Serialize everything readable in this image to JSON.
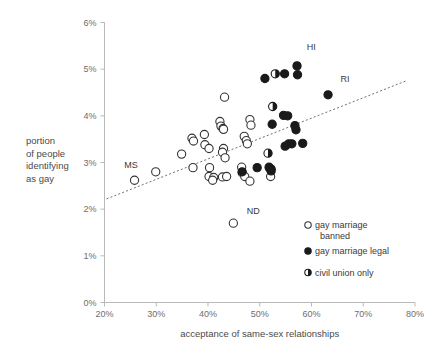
{
  "chart_data": {
    "type": "scatter",
    "title": "",
    "xlabel": "acceptance of same-sex relationships",
    "ylabel": "portion of people identifying as gay",
    "ylabel_lines": [
      "portion",
      "of people",
      "identifying",
      "as gay"
    ],
    "xlim": [
      20,
      80
    ],
    "ylim": [
      0,
      6
    ],
    "xticks": [
      "20%",
      "30%",
      "40%",
      "50%",
      "60%",
      "70%",
      "80%"
    ],
    "xtick_values": [
      20,
      30,
      40,
      50,
      60,
      70,
      80
    ],
    "yticks": [
      "0%",
      "1%",
      "2%",
      "3%",
      "4%",
      "5%",
      "6%"
    ],
    "ytick_values": [
      0,
      1,
      2,
      3,
      4,
      5,
      6
    ],
    "grid": false,
    "legend_position": "bottom-right",
    "trendline": {
      "x0": 20.4,
      "y0": 2.22,
      "x1": 78.3,
      "y1": 4.75,
      "style": "dashed"
    },
    "series": [
      {
        "name": "gay marriage banned",
        "marker": "open-circle",
        "color": "#ffffff",
        "edge_color": "#333333",
        "points": [
          {
            "x": 25.8,
            "y": 2.62
          },
          {
            "x": 29.9,
            "y": 2.8
          },
          {
            "x": 34.9,
            "y": 3.18
          },
          {
            "x": 36.9,
            "y": 3.52
          },
          {
            "x": 37.2,
            "y": 3.46
          },
          {
            "x": 37.1,
            "y": 2.89
          },
          {
            "x": 39.3,
            "y": 3.6
          },
          {
            "x": 39.4,
            "y": 3.38
          },
          {
            "x": 40.2,
            "y": 3.3
          },
          {
            "x": 40.3,
            "y": 2.89
          },
          {
            "x": 40.2,
            "y": 2.7
          },
          {
            "x": 41.1,
            "y": 2.68
          },
          {
            "x": 40.9,
            "y": 2.62
          },
          {
            "x": 42.3,
            "y": 3.88
          },
          {
            "x": 42.5,
            "y": 3.78
          },
          {
            "x": 42.9,
            "y": 3.73
          },
          {
            "x": 43.0,
            "y": 3.71
          },
          {
            "x": 43.2,
            "y": 4.4
          },
          {
            "x": 43.0,
            "y": 3.3
          },
          {
            "x": 42.8,
            "y": 3.22
          },
          {
            "x": 43.3,
            "y": 3.1
          },
          {
            "x": 42.8,
            "y": 2.69
          },
          {
            "x": 43.6,
            "y": 2.7
          },
          {
            "x": 44.9,
            "y": 1.7
          },
          {
            "x": 46.5,
            "y": 2.9
          },
          {
            "x": 46.6,
            "y": 2.78
          },
          {
            "x": 47.1,
            "y": 2.7
          },
          {
            "x": 47.0,
            "y": 3.56
          },
          {
            "x": 47.4,
            "y": 3.47
          },
          {
            "x": 47.6,
            "y": 3.4
          },
          {
            "x": 48.1,
            "y": 3.92
          },
          {
            "x": 48.3,
            "y": 3.8
          },
          {
            "x": 48.1,
            "y": 2.6
          },
          {
            "x": 51.9,
            "y": 2.88
          },
          {
            "x": 52.1,
            "y": 2.7
          }
        ]
      },
      {
        "name": "gay marriage legal",
        "marker": "filled-circle",
        "color": "#1a1a1a",
        "points": [
          {
            "x": 51.0,
            "y": 4.8
          },
          {
            "x": 54.8,
            "y": 4.9
          },
          {
            "x": 57.2,
            "y": 5.07
          },
          {
            "x": 57.3,
            "y": 4.88
          },
          {
            "x": 63.2,
            "y": 4.45
          },
          {
            "x": 52.4,
            "y": 3.82
          },
          {
            "x": 54.6,
            "y": 4.01
          },
          {
            "x": 55.4,
            "y": 4.0
          },
          {
            "x": 56.8,
            "y": 3.79
          },
          {
            "x": 57.0,
            "y": 3.7
          },
          {
            "x": 54.9,
            "y": 3.35
          },
          {
            "x": 55.6,
            "y": 3.4
          },
          {
            "x": 56.2,
            "y": 3.4
          },
          {
            "x": 58.3,
            "y": 3.41
          },
          {
            "x": 46.6,
            "y": 2.8
          },
          {
            "x": 49.5,
            "y": 2.89
          },
          {
            "x": 51.8,
            "y": 2.9
          },
          {
            "x": 52.2,
            "y": 2.82
          }
        ]
      },
      {
        "name": "civil union only",
        "marker": "half-circle",
        "color": "#1a1a1a",
        "points": [
          {
            "x": 53.0,
            "y": 4.9
          },
          {
            "x": 52.5,
            "y": 4.2
          },
          {
            "x": 51.6,
            "y": 3.2
          },
          {
            "x": 52.2,
            "y": 2.86
          }
        ]
      }
    ],
    "annotations": [
      {
        "text": "MS",
        "x": 25.8,
        "y": 2.62,
        "dx": -2,
        "dy": 0.33
      },
      {
        "text": "ND",
        "x": 44.9,
        "y": 1.7,
        "dx": 2.6,
        "dy": 0.27
      },
      {
        "text": "HI",
        "x": 57.2,
        "y": 5.07,
        "dx": 1.9,
        "dy": 0.4
      },
      {
        "text": "RI",
        "x": 63.2,
        "y": 4.45,
        "dx": 2.4,
        "dy": 0.33
      }
    ]
  },
  "legend": {
    "entries": [
      {
        "label_line1": "gay marriage",
        "label_line2": "banned",
        "marker": "open-circle"
      },
      {
        "label_line1": "gay marriage legal",
        "label_line2": "",
        "marker": "filled-circle"
      },
      {
        "label_line1": "civil union only",
        "label_line2": "",
        "marker": "half-circle"
      }
    ]
  },
  "colors": {
    "axis": "#b9b9b9",
    "text": "#3a3a3a",
    "tick_text": "#6e6e6e",
    "marker_dark": "#1a1a1a",
    "trend": "#6f6f6f",
    "background": "#ffffff"
  }
}
